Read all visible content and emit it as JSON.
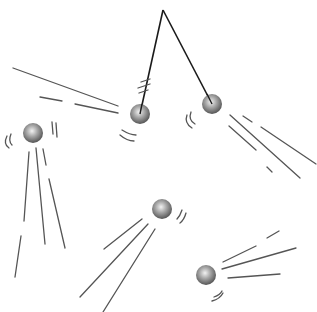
{
  "figure": {
    "title": "",
    "colors": {
      "background": "#ffffff",
      "string": "#1a1a1a",
      "motion_line": "#555555",
      "ball_light": "#e6e6e6",
      "ball_mid": "#9a9a9a",
      "ball_dark": "#5a5a5a"
    }
  },
  "pendulum": {
    "pivot": [
      163,
      10
    ],
    "balls": [
      {
        "name": "left-bob",
        "cx": 140,
        "cy": 114,
        "r": 10
      },
      {
        "name": "right-bob",
        "cx": 212,
        "cy": 104,
        "r": 10
      }
    ]
  },
  "free_balls": [
    {
      "name": "ball-far-left",
      "cx": 33,
      "cy": 133,
      "r": 10
    },
    {
      "name": "ball-center",
      "cx": 162,
      "cy": 209,
      "r": 10
    },
    {
      "name": "ball-bottom-right",
      "cx": 206,
      "cy": 275,
      "r": 10
    }
  ]
}
